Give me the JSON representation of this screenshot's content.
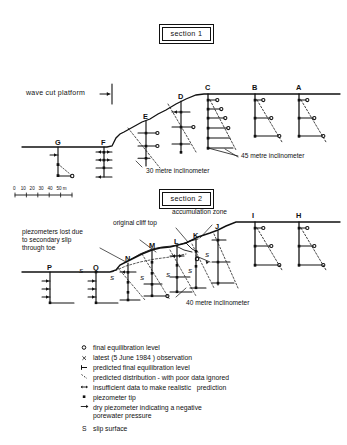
{
  "figure": {
    "title_sections": [
      {
        "id": "section-1",
        "label": "section 1"
      },
      {
        "id": "section-2",
        "label": "section 2"
      }
    ],
    "scale_bar": {
      "ticks": [
        "0",
        "10",
        "20",
        "30",
        "40",
        "50"
      ],
      "unit": "m",
      "text": "0    10   20   30   40   50 m"
    },
    "section1": {
      "name": "section 1",
      "platform_label": "wave cut platform",
      "boreholes": [
        "G",
        "F",
        "E",
        "D",
        "C",
        "B",
        "A"
      ],
      "annotations": [
        {
          "name": "inclinometer-30m",
          "text": "30 metre inclinometer"
        },
        {
          "name": "inclinometer-45m",
          "text": "45 metre inclinometer"
        }
      ]
    },
    "section2": {
      "name": "section 2",
      "boreholes": [
        "P",
        "Q",
        "N",
        "M",
        "L",
        "K",
        "J",
        "I",
        "H"
      ],
      "annotations": [
        {
          "name": "accumulation-zone",
          "text": "accumulation zone"
        },
        {
          "name": "original-cliff-top",
          "text": "original cliff top"
        },
        {
          "name": "piezometers-lost",
          "text": "piezometers lost due\nto secondary slip\nthrough toe"
        },
        {
          "name": "inclinometer-40m",
          "text": "40 metre inclinometer"
        }
      ],
      "slip_markers": [
        "S",
        "S",
        "S",
        "S",
        "S",
        "S"
      ]
    },
    "legend": {
      "items": [
        {
          "symbol": "o",
          "symbol_name": "open-circle-symbol",
          "text": "final equilibration level"
        },
        {
          "symbol": "x",
          "symbol_name": "cross-symbol",
          "text": "latest (5 June 1984 ) observation"
        },
        {
          "symbol": "⊢",
          "symbol_name": "tick-bar-symbol",
          "text": "predicted final equilibration level"
        },
        {
          "symbol": "╲",
          "symbol_name": "dashed-line-symbol",
          "text": "predicted distribution - with poor data ignored"
        },
        {
          "symbol": "↔",
          "symbol_name": "short-dash-symbol",
          "text": "insufficient data to make realistic   prediction"
        },
        {
          "symbol": "▪",
          "symbol_name": "filled-square-symbol",
          "text": "piezometer tip"
        },
        {
          "symbol": "→",
          "symbol_name": "arrow-symbol",
          "text": "dry piezometer indicating a negative\nporewater pressure"
        },
        {
          "symbol": "S",
          "symbol_name": "slip-surface-symbol",
          "text": "slip surface"
        }
      ]
    }
  }
}
